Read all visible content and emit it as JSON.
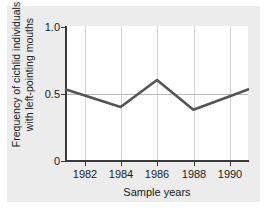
{
  "figure": {
    "background_color": "#ececed",
    "plot_background_color": "#ffffff",
    "axis_color": "#3a3a3a",
    "gridline_color": "#d2d2d2",
    "series_color": "#555555"
  },
  "chart_data": {
    "type": "line",
    "title": "",
    "xlabel": "Sample years",
    "ylabel": "Frequency of cichlid individuals with left-pointing mouths",
    "ylabel_line1": "Frequency of cichlid individuals",
    "ylabel_line2": "with left-pointing mouths",
    "xlim": [
      1981,
      1991
    ],
    "ylim": [
      0,
      1.0
    ],
    "ytick_labels": [
      "1.0",
      "0.5",
      "0"
    ],
    "ytick_values": [
      1.0,
      0.5,
      0
    ],
    "xtick_labels": [
      "1982",
      "1984",
      "1986",
      "1988",
      "1990"
    ],
    "xtick_values": [
      1982,
      1984,
      1986,
      1988,
      1990
    ],
    "grid": "vertical gridlines at each x tick, horizontal gridline at y=0.5",
    "legend": "none",
    "series": [
      {
        "name": "Frequency of left-pointing mouths",
        "color": "#555555",
        "x": [
          1981,
          1984,
          1986,
          1988,
          1991
        ],
        "values": [
          0.53,
          0.4,
          0.6,
          0.38,
          0.53
        ]
      }
    ]
  }
}
